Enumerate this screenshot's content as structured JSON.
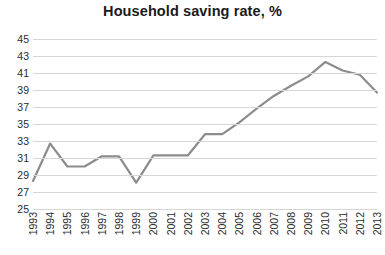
{
  "chart_data": {
    "type": "line",
    "title": "Household saving rate, %",
    "xlabel": "",
    "ylabel": "",
    "ylim": [
      25,
      45
    ],
    "ytick_step": 2,
    "yticks": [
      45,
      43,
      41,
      39,
      37,
      35,
      33,
      31,
      29,
      27,
      25
    ],
    "grid": true,
    "legend": false,
    "legend_position": "none",
    "line_color": "#8c8c8c",
    "gridline_color": "#d6d6d6",
    "background_color": "#ffffff",
    "text_color": "#2b2b2b",
    "categories": [
      "1993",
      "1994",
      "1995",
      "1996",
      "1997",
      "1998",
      "1999",
      "2000",
      "2001",
      "2002",
      "2003",
      "2004",
      "2005",
      "2006",
      "2007",
      "2008",
      "2009",
      "2010",
      "2011",
      "2012",
      "2013"
    ],
    "values": [
      28.3,
      32.7,
      30.0,
      30.0,
      31.2,
      31.2,
      28.1,
      31.3,
      31.3,
      31.3,
      33.8,
      33.8,
      35.2,
      36.8,
      38.3,
      39.5,
      40.6,
      42.3,
      41.3,
      40.8,
      38.7
    ],
    "series": [
      {
        "name": "Household saving rate",
        "values": [
          28.3,
          32.7,
          30.0,
          30.0,
          31.2,
          31.2,
          28.1,
          31.3,
          31.3,
          31.3,
          33.8,
          33.8,
          35.2,
          36.8,
          38.3,
          39.5,
          40.6,
          42.3,
          41.3,
          40.8,
          38.7
        ]
      }
    ]
  }
}
